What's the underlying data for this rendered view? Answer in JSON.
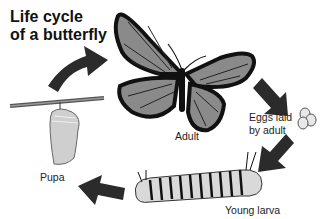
{
  "title": {
    "line1": "Life cycle",
    "line2": "of a butterfly"
  },
  "stages": {
    "adult": "Adult",
    "eggs_line1": "Eggs laid",
    "eggs_line2": "by adult",
    "larva": "Young larva",
    "pupa": "Pupa"
  },
  "icons": [
    "butterfly-icon",
    "eggs-icon",
    "caterpillar-icon",
    "chrysalis-icon",
    "arrow-icon"
  ],
  "colors": {
    "wing": "#8a8a8a",
    "outline": "#111111",
    "arrow": "#2b2b2b",
    "background": "#ffffff"
  }
}
